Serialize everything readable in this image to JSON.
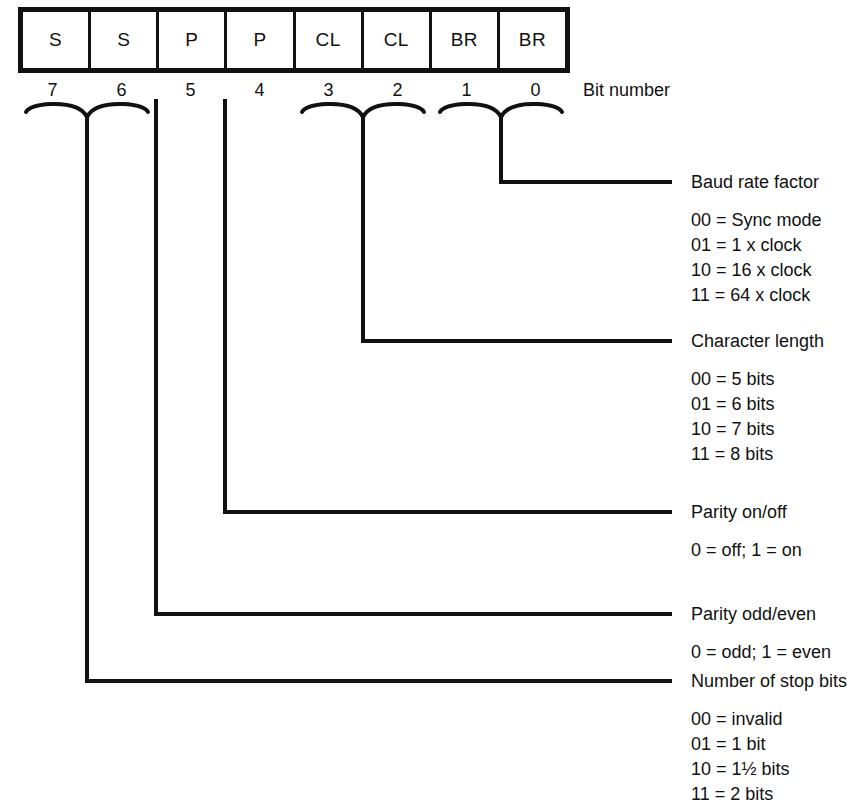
{
  "diagram": {
    "register": {
      "cells": [
        {
          "label": "S",
          "bit": "7"
        },
        {
          "label": "S",
          "bit": "6"
        },
        {
          "label": "P",
          "bit": "5"
        },
        {
          "label": "P",
          "bit": "4"
        },
        {
          "label": "CL",
          "bit": "3"
        },
        {
          "label": "CL",
          "bit": "2"
        },
        {
          "label": "BR",
          "bit": "1"
        },
        {
          "label": "BR",
          "bit": "0"
        }
      ],
      "axis_label": "Bit number"
    },
    "fields": [
      {
        "name": "baud-rate-factor",
        "heading": "Baud rate factor",
        "bits": "1-0",
        "options": [
          "00 = Sync mode",
          "01 = 1 x clock",
          "10 = 16 x clock",
          "11 = 64 x clock"
        ]
      },
      {
        "name": "character-length",
        "heading": "Character length",
        "bits": "3-2",
        "options": [
          "00 = 5 bits",
          "01 = 6 bits",
          "10 = 7 bits",
          "11 = 8 bits"
        ]
      },
      {
        "name": "parity-on-off",
        "heading": "Parity on/off",
        "bits": "4",
        "options": [
          "0 = off; 1 = on"
        ]
      },
      {
        "name": "parity-odd-even",
        "heading": "Parity odd/even",
        "bits": "5",
        "options": [
          "0 = odd; 1 = even"
        ]
      },
      {
        "name": "number-of-stop-bits",
        "heading": "Number of stop bits",
        "bits": "7-6",
        "options": [
          "00 = invalid",
          "01 = 1 bit",
          "10 = 1½ bits",
          "11 = 2 bits"
        ]
      }
    ],
    "colors": {
      "ink": "#111111",
      "paper": "#ffffff"
    }
  }
}
